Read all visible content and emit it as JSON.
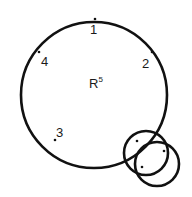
{
  "diagram": {
    "stroke_color": "#111111",
    "background": "#ffffff",
    "main_circle": {
      "label": "R",
      "label_superscript": "5",
      "points": [
        {
          "label": "1",
          "position": "top"
        },
        {
          "label": "2",
          "position": "upper-right"
        },
        {
          "label": "3",
          "position": "lower-left"
        },
        {
          "label": "4",
          "position": "upper-left"
        }
      ]
    },
    "small_circles": [
      {
        "name": "overlap-circle-a",
        "dots": 2
      },
      {
        "name": "overlap-circle-b",
        "dots": 1
      }
    ]
  }
}
